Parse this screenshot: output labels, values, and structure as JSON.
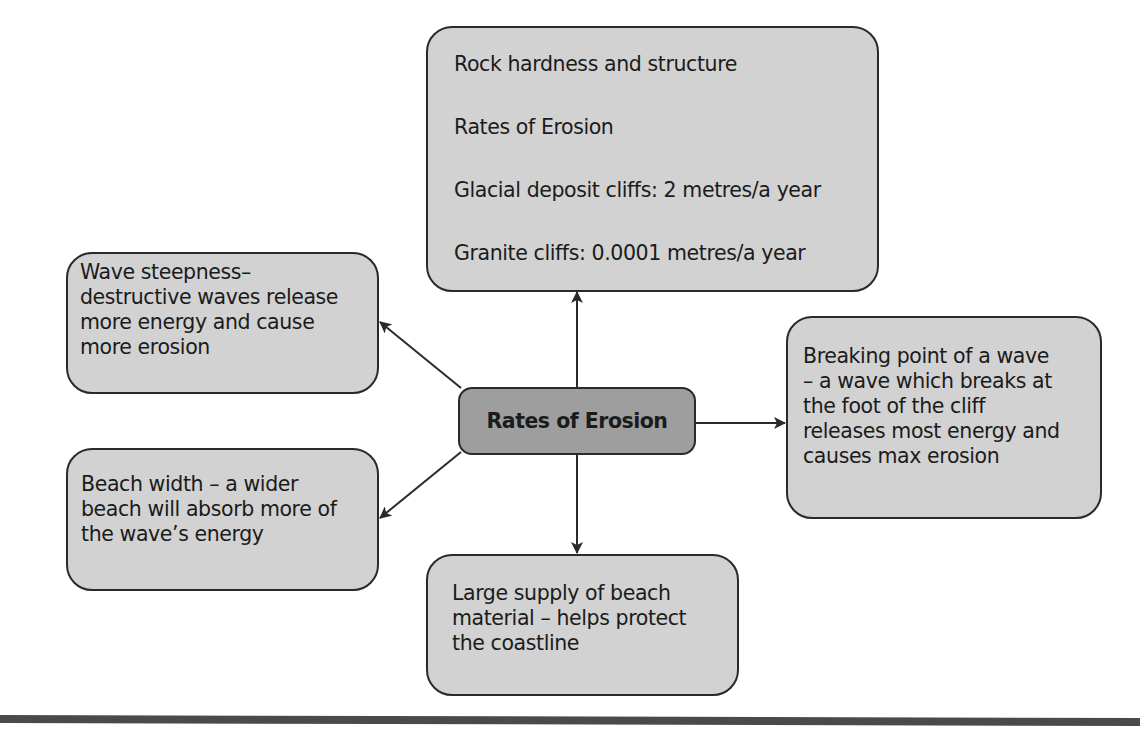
{
  "diagram": {
    "center": {
      "label": "Rates of Erosion"
    },
    "nodes": {
      "top": {
        "lines": [
          "Rock hardness and structure",
          "Rates of Erosion",
          "Glacial deposit cliffs: 2 metres/a year",
          "Granite cliffs: 0.0001 metres/a year"
        ]
      },
      "left_top": {
        "lines": [
          "Wave steepness–",
          "destructive waves release",
          "more energy and cause",
          "more erosion"
        ]
      },
      "left_bottom": {
        "lines": [
          "Beach width – a wider",
          "beach will absorb more of",
          "the wave’s energy"
        ]
      },
      "right": {
        "lines": [
          "Breaking point of a wave",
          "– a wave which breaks at",
          "the foot of the cliff",
          "releases most energy and",
          "causes max erosion"
        ]
      },
      "bottom": {
        "lines": [
          "Large supply of beach",
          "material – helps protect",
          "the coastline"
        ]
      }
    },
    "colors": {
      "node_fill": "#d2d2d2",
      "center_fill": "#9e9e9e",
      "border": "#2a2a2a",
      "arrow": "#2a2a2a",
      "rule": "#4a4a4a"
    }
  }
}
